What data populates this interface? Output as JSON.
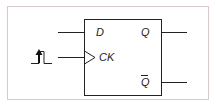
{
  "diagram": {
    "labels": {
      "d": "D",
      "q": "Q",
      "ck": "CK",
      "qbar": "Q"
    },
    "colors": {
      "frame": "#d9c9c9",
      "stroke": "#222222"
    },
    "clock_icon": "rising-edge-pulse"
  }
}
